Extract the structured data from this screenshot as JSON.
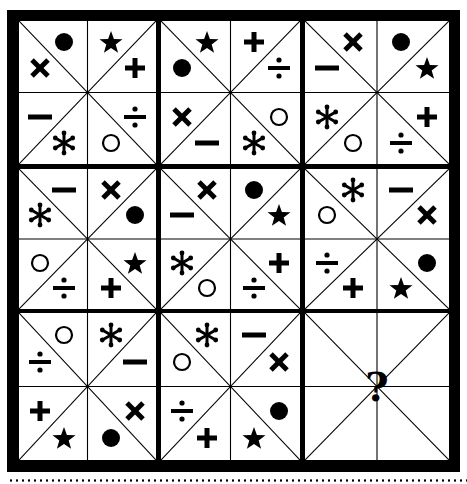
{
  "puzzle": {
    "description": "3x3 grid of squares, each divided into 8 triangles by diagonals and midlines; find the missing square",
    "slot_order": [
      "top-left",
      "top-right",
      "right-upper",
      "right-lower",
      "bottom-right",
      "bottom-left",
      "left-lower",
      "left-upper"
    ],
    "cells": [
      {
        "row": 1,
        "col": 1,
        "symbols": [
          "circle-filled",
          "star",
          "plus",
          "divide",
          "circle-open",
          "asterisk",
          "minus",
          "times"
        ]
      },
      {
        "row": 1,
        "col": 2,
        "symbols": [
          "star",
          "plus",
          "divide",
          "circle-open",
          "asterisk",
          "minus",
          "times",
          "circle-filled"
        ]
      },
      {
        "row": 1,
        "col": 3,
        "symbols": [
          "times",
          "circle-filled",
          "star",
          "plus",
          "divide",
          "circle-open",
          "asterisk",
          "minus"
        ]
      },
      {
        "row": 2,
        "col": 1,
        "symbols": [
          "minus",
          "times",
          "circle-filled",
          "star",
          "plus",
          "divide",
          "circle-open",
          "asterisk"
        ]
      },
      {
        "row": 2,
        "col": 2,
        "symbols": [
          "times",
          "circle-filled",
          "star",
          "plus",
          "divide",
          "circle-open",
          "asterisk",
          "minus"
        ]
      },
      {
        "row": 2,
        "col": 3,
        "symbols": [
          "asterisk",
          "minus",
          "times",
          "circle-filled",
          "star",
          "plus",
          "divide",
          "circle-open"
        ]
      },
      {
        "row": 3,
        "col": 1,
        "symbols": [
          "circle-open",
          "asterisk",
          "minus",
          "times",
          "circle-filled",
          "star",
          "plus",
          "divide"
        ]
      },
      {
        "row": 3,
        "col": 2,
        "symbols": [
          "asterisk",
          "minus",
          "times",
          "circle-filled",
          "star",
          "plus",
          "divide",
          "circle-open"
        ]
      },
      {
        "row": 3,
        "col": 3,
        "symbols": [],
        "question_mark": "?"
      }
    ]
  },
  "colors": {
    "ink": "#000000",
    "paper": "#ffffff"
  }
}
